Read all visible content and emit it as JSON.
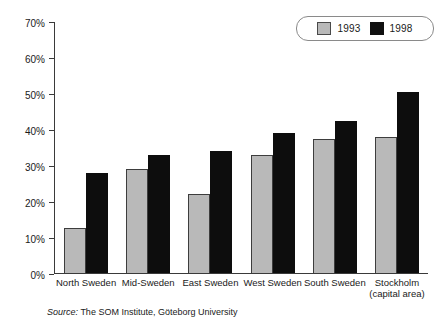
{
  "chart_data": {
    "type": "bar",
    "title": "",
    "xlabel": "",
    "ylabel": "",
    "ylim": [
      0,
      70
    ],
    "ytick_labels": [
      "70%",
      "60%",
      "50%",
      "40%",
      "30%",
      "20%",
      "10%",
      "0%"
    ],
    "ytick_values": [
      70,
      60,
      50,
      40,
      30,
      20,
      10,
      0
    ],
    "grid": false,
    "legend_position": "top-right",
    "categories": [
      "North Sweden",
      "Mid-Sweden",
      "East Sweden",
      "West Sweden",
      "South Sweden",
      "Stockholm"
    ],
    "category_sublabels": [
      "",
      "",
      "",
      "",
      "",
      "(capital area)"
    ],
    "series": [
      {
        "name": "1993",
        "color": "#b9b9b9",
        "values": [
          12.5,
          29,
          22,
          33,
          37.5,
          38
        ]
      },
      {
        "name": "1998",
        "color": "#0d0d0d",
        "values": [
          28,
          33,
          34,
          39,
          42.5,
          50.5
        ]
      }
    ]
  },
  "legend": {
    "entries": [
      {
        "label": "1993",
        "swatch": "gray-swatch"
      },
      {
        "label": "1998",
        "swatch": "black-swatch"
      }
    ]
  },
  "source": {
    "label": "Source:",
    "text": "The SOM Institute, Göteborg University"
  }
}
